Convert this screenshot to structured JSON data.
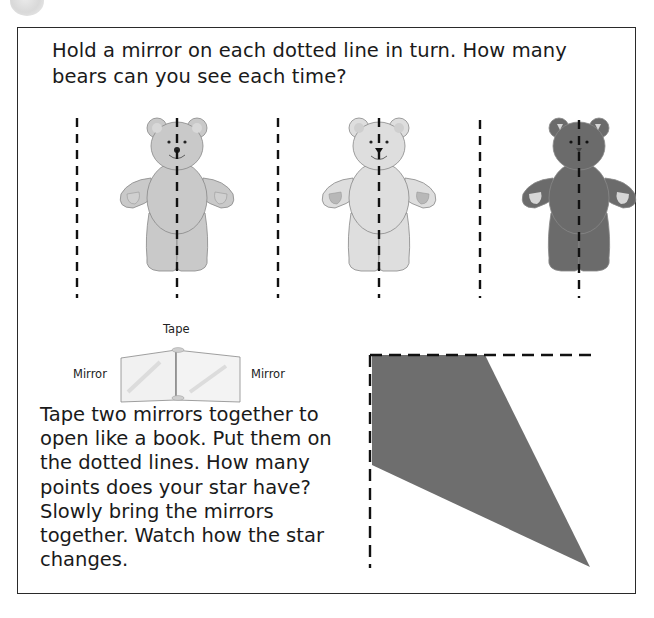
{
  "activity1": {
    "instruction": "Hold a mirror on each dotted line in turn. How many bears can you see each time?",
    "bears": [
      {
        "shade": "light-gray",
        "fill": "#c9c9c9",
        "paw": "#d8d8d8"
      },
      {
        "shade": "pale-gray",
        "fill": "#dedede",
        "paw": "#b8b8b8"
      },
      {
        "shade": "dark-gray",
        "fill": "#6b6b6b",
        "paw": "#d6d6d6"
      }
    ]
  },
  "diagram": {
    "tape_label": "Tape",
    "mirror_left_label": "Mirror",
    "mirror_right_label": "Mirror"
  },
  "activity2": {
    "instruction": "Tape two mirrors together to open like a book. Put them on the dotted lines. How many points does your star have? Slowly bring the mirrors together. Watch how the star changes."
  },
  "colors": {
    "frame": "#2a2a2a",
    "star_shape": "#6e6e6e",
    "dashes": "#111111"
  }
}
